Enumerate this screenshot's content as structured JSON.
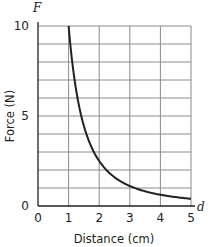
{
  "chart_data": {
    "type": "line",
    "title": "",
    "xlabel": "Distance (cm)",
    "ylabel": "Force (N)",
    "x_axis_variable": "d",
    "y_axis_variable": "F",
    "xlim": [
      0,
      5
    ],
    "ylim": [
      0,
      10
    ],
    "x_ticks": [
      "0",
      "1",
      "2",
      "3",
      "4",
      "5"
    ],
    "y_ticks": [
      "0",
      "5",
      "10"
    ],
    "grid": true,
    "x_grid_step": 1,
    "y_grid_step": 1,
    "series": [
      {
        "name": "F = 10/d^2",
        "x": [
          1,
          1.25,
          1.5,
          1.75,
          2,
          2.5,
          3,
          3.5,
          4,
          4.5,
          5
        ],
        "y": [
          10,
          6.4,
          4.44,
          3.27,
          2.5,
          1.6,
          1.11,
          0.82,
          0.625,
          0.49,
          0.4
        ]
      }
    ]
  }
}
